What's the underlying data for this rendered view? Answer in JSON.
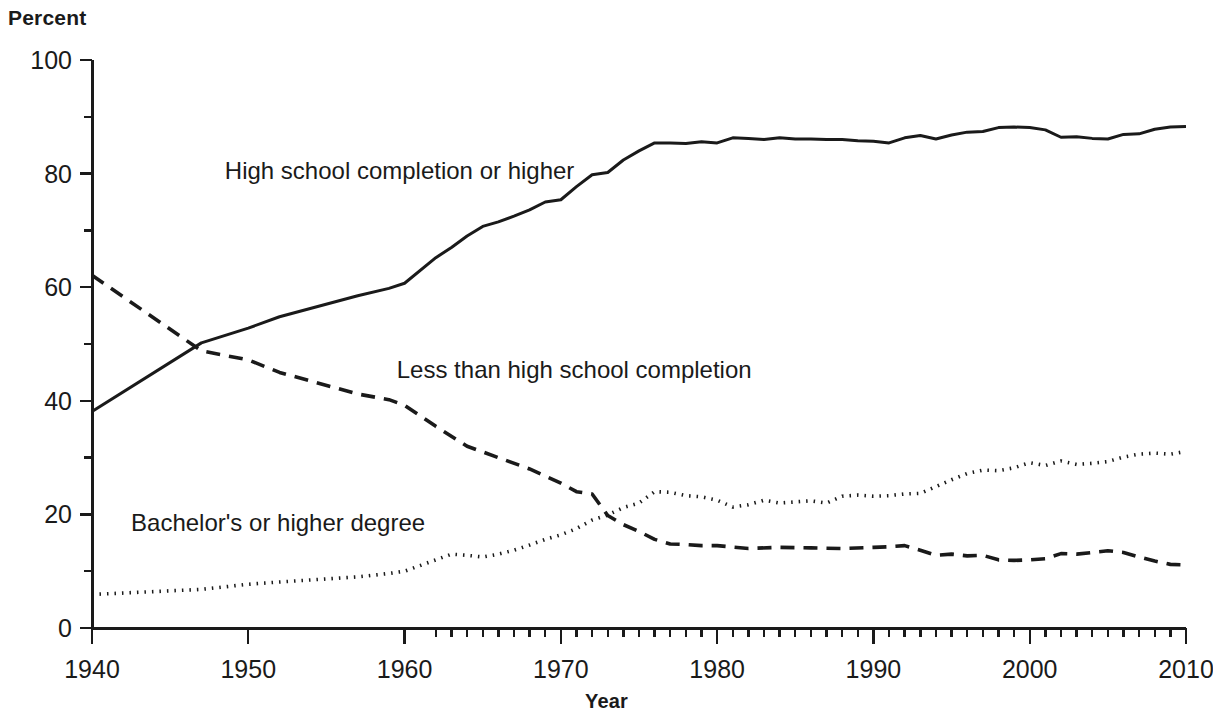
{
  "chart_data": {
    "type": "line",
    "title": "",
    "xlabel": "Year",
    "ylabel": "Percent",
    "xlim": [
      1940,
      2010
    ],
    "ylim": [
      0,
      100
    ],
    "grid": false,
    "legend_position": "inline-annotations",
    "y_ticks_major": [
      0,
      20,
      40,
      60,
      80,
      100
    ],
    "y_ticks_minor": [
      10,
      30,
      50,
      70,
      90
    ],
    "x_ticks_major": [
      1940,
      1950,
      1960,
      1970,
      1980,
      1990,
      2000,
      2010
    ],
    "x_tick_labels": [
      "1940",
      "1950",
      "1960",
      "1970",
      "1980",
      "1990",
      "2000",
      "2010"
    ],
    "y_tick_labels": [
      "0",
      "20",
      "40",
      "60",
      "80",
      "100"
    ],
    "x_minor_tick_start": 1962,
    "x_minor_tick_end": 2010,
    "series": [
      {
        "name": "High school completion or higher",
        "style": "solid",
        "label_x": 1948.5,
        "label_y": 79,
        "x": [
          1940,
          1947,
          1950,
          1952,
          1957,
          1959,
          1960,
          1962,
          1963,
          1964,
          1965,
          1966,
          1967,
          1968,
          1969,
          1970,
          1971,
          1972,
          1973,
          1974,
          1975,
          1976,
          1977,
          1978,
          1979,
          1980,
          1981,
          1982,
          1983,
          1984,
          1985,
          1986,
          1987,
          1988,
          1989,
          1990,
          1991,
          1992,
          1993,
          1994,
          1995,
          1996,
          1997,
          1998,
          1999,
          2000,
          2001,
          2002,
          2003,
          2004,
          2005,
          2006,
          2007,
          2008,
          2009,
          2010
        ],
        "values": [
          38.1,
          50.2,
          52.8,
          54.8,
          58.5,
          59.8,
          60.7,
          65.2,
          67.0,
          69.0,
          70.7,
          71.5,
          72.5,
          73.6,
          75.0,
          75.4,
          77.7,
          79.8,
          80.2,
          82.4,
          84.0,
          85.4,
          85.4,
          85.3,
          85.6,
          85.4,
          86.3,
          86.2,
          86.0,
          86.3,
          86.1,
          86.1,
          86.0,
          86.0,
          85.8,
          85.7,
          85.4,
          86.3,
          86.7,
          86.1,
          86.8,
          87.3,
          87.4,
          88.1,
          88.2,
          88.1,
          87.7,
          86.4,
          86.5,
          86.2,
          86.1,
          86.9,
          87.0,
          87.8,
          88.2,
          88.3
        ]
      },
      {
        "name": "Less than high school completion",
        "style": "dashed",
        "label_x": 1959.5,
        "label_y": 44,
        "x": [
          1940,
          1947,
          1950,
          1952,
          1957,
          1959,
          1960,
          1962,
          1964,
          1965,
          1966,
          1968,
          1970,
          1971,
          1972,
          1973,
          1974,
          1975,
          1976,
          1977,
          1978,
          1979,
          1980,
          1982,
          1984,
          1986,
          1988,
          1990,
          1991,
          1992,
          1993,
          1994,
          1995,
          1996,
          1997,
          1998,
          1999,
          2000,
          2001,
          2002,
          2003,
          2004,
          2005,
          2006,
          2007,
          2008,
          2009,
          2010
        ],
        "values": [
          62.1,
          48.8,
          47.2,
          45.0,
          41.2,
          40.2,
          39.2,
          35.5,
          32.0,
          31.0,
          30.0,
          28.0,
          25.5,
          24.0,
          23.6,
          19.8,
          18.2,
          17.0,
          15.6,
          14.8,
          14.7,
          14.5,
          14.5,
          14.0,
          14.2,
          14.1,
          14.0,
          14.2,
          14.3,
          14.5,
          13.7,
          12.8,
          13.0,
          12.7,
          12.8,
          12.0,
          11.9,
          12.0,
          12.2,
          13.1,
          13.0,
          13.3,
          13.6,
          13.3,
          12.5,
          11.8,
          11.2,
          11.1
        ]
      },
      {
        "name": "Bachelor's or higher degree",
        "style": "dotted",
        "label_x": 1942.5,
        "label_y": 17,
        "x": [
          1940,
          1947,
          1950,
          1952,
          1957,
          1959,
          1960,
          1962,
          1963,
          1964,
          1965,
          1966,
          1967,
          1968,
          1969,
          1970,
          1971,
          1972,
          1973,
          1974,
          1975,
          1976,
          1977,
          1978,
          1979,
          1980,
          1981,
          1982,
          1983,
          1984,
          1985,
          1986,
          1987,
          1988,
          1989,
          1990,
          1991,
          1992,
          1993,
          1994,
          1995,
          1996,
          1997,
          1998,
          1999,
          2000,
          2001,
          2002,
          2003,
          2004,
          2005,
          2006,
          2007,
          2008,
          2009,
          2010
        ],
        "values": [
          5.9,
          6.8,
          7.7,
          8.1,
          9.0,
          9.6,
          10.0,
          12.0,
          13.0,
          12.8,
          12.5,
          13.0,
          13.7,
          14.6,
          15.6,
          16.4,
          17.5,
          19.0,
          19.9,
          21.2,
          22.0,
          24.0,
          23.9,
          23.3,
          23.1,
          22.5,
          21.3,
          21.7,
          22.5,
          22.0,
          22.2,
          22.4,
          22.0,
          23.2,
          23.4,
          23.2,
          23.3,
          23.6,
          23.7,
          24.9,
          26.1,
          27.2,
          27.8,
          27.7,
          28.2,
          29.1,
          28.6,
          29.4,
          28.8,
          29.0,
          29.3,
          30.1,
          30.6,
          30.8,
          30.6,
          31.1
        ]
      }
    ]
  },
  "axis": {
    "y_title": "Percent",
    "x_title": "Year"
  }
}
